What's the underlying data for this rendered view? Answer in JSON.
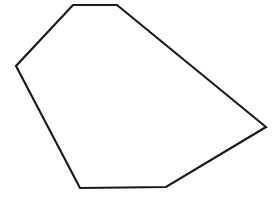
{
  "page": {
    "width": 277,
    "height": 198,
    "background_color": "#ffffff"
  },
  "figure": {
    "name": "irregular-hexagon",
    "shape_type": "polygon",
    "sides": 6,
    "stroke_color": "#1a1a1a",
    "fill_color": "#ffffff",
    "stroke_width": 2.2,
    "closed": true,
    "vertices": [
      {
        "label": "top-left",
        "x": 73,
        "y": 5
      },
      {
        "label": "top-right",
        "x": 117,
        "y": 5
      },
      {
        "label": "right",
        "x": 266,
        "y": 127
      },
      {
        "label": "bottom-right",
        "x": 166,
        "y": 187
      },
      {
        "label": "bottom-left",
        "x": 80,
        "y": 188
      },
      {
        "label": "left",
        "x": 16,
        "y": 66
      }
    ],
    "points_string": "73,5 117,5 266,127 166,187 80,188 16,66"
  },
  "artifact": {
    "name": "faint-smudge",
    "color": "#fafafa",
    "cx": 152,
    "cy": 139,
    "rx": 5,
    "ry": 8
  }
}
